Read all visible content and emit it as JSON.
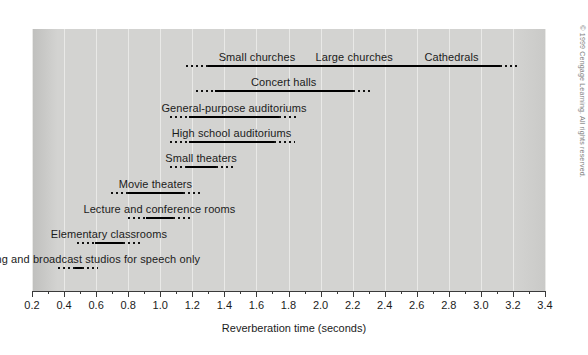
{
  "figure": {
    "copyright": "© 1999 Cengage Learning. All rights reserved.",
    "panel_color": "#d3d3d1",
    "line_color": "#000000",
    "grid_color": "#e9e9e7"
  },
  "chart_data": {
    "type": "bar",
    "orientation": "horizontal",
    "title": "",
    "xlabel": "Reverberation time (seconds)",
    "ylabel": "",
    "xlim": [
      0.2,
      3.4
    ],
    "xticks": [
      0.2,
      0.4,
      0.6,
      0.8,
      1.0,
      1.2,
      1.4,
      1.6,
      1.8,
      2.0,
      2.2,
      2.4,
      2.6,
      2.8,
      3.0,
      3.2,
      3.4
    ],
    "xticklabels": [
      "0.2",
      "0.4",
      "0.6",
      "0.8",
      "1.0",
      "1.2",
      "1.4",
      "1.6",
      "1.8",
      "2.0",
      "2.2",
      "2.4",
      "2.6",
      "2.8",
      "3.0",
      "3.2",
      "3.4"
    ],
    "minor_ticks_between_majors": 1,
    "grid": true,
    "legend": "none",
    "note": "Each row is a range bar: a solid central span with dotted (uncertain) extensions at both ends. Values are reverberation times in seconds.",
    "categories": [
      "Small churches / Large churches / Cathedrals",
      "Concert halls",
      "General-purpose auditoriums",
      "High school auditoriums",
      "Small theaters",
      "Movie theaters",
      "Lecture and conference rooms",
      "Elementary classrooms",
      "Recording and broadcast studios for speech only"
    ],
    "bars": [
      {
        "labels": [
          "Small churches",
          "Large churches",
          "Cathedrals"
        ],
        "dotted_start": 1.16,
        "solid_start": 1.3,
        "solid_end": 3.12,
        "dotted_end": 3.24
      },
      {
        "labels": [
          "Concert halls"
        ],
        "dotted_start": 1.22,
        "solid_start": 1.34,
        "solid_end": 2.2,
        "dotted_end": 2.31
      },
      {
        "labels": [
          "General-purpose auditoriums"
        ],
        "dotted_start": 1.06,
        "solid_start": 1.18,
        "solid_end": 1.74,
        "dotted_end": 1.86
      },
      {
        "labels": [
          "High school auditoriums"
        ],
        "dotted_start": 1.06,
        "solid_start": 1.18,
        "solid_end": 1.71,
        "dotted_end": 1.84
      },
      {
        "labels": [
          "Small theaters"
        ],
        "dotted_start": 1.06,
        "solid_start": 1.16,
        "solid_end": 1.35,
        "dotted_end": 1.46
      },
      {
        "labels": [
          "Movie theaters"
        ],
        "dotted_start": 0.69,
        "solid_start": 0.8,
        "solid_end": 1.14,
        "dotted_end": 1.25
      },
      {
        "labels": [
          "Lecture and conference rooms"
        ],
        "dotted_start": 0.8,
        "solid_start": 0.91,
        "solid_end": 1.08,
        "dotted_end": 1.19
      },
      {
        "labels": [
          "Elementary classrooms"
        ],
        "dotted_start": 0.48,
        "solid_start": 0.59,
        "solid_end": 0.77,
        "dotted_end": 0.89
      },
      {
        "labels": [
          "Recording and broadcast studios for speech only"
        ],
        "dotted_start": 0.36,
        "solid_start": 0.47,
        "solid_end": 0.51,
        "dotted_end": 0.61
      }
    ]
  }
}
